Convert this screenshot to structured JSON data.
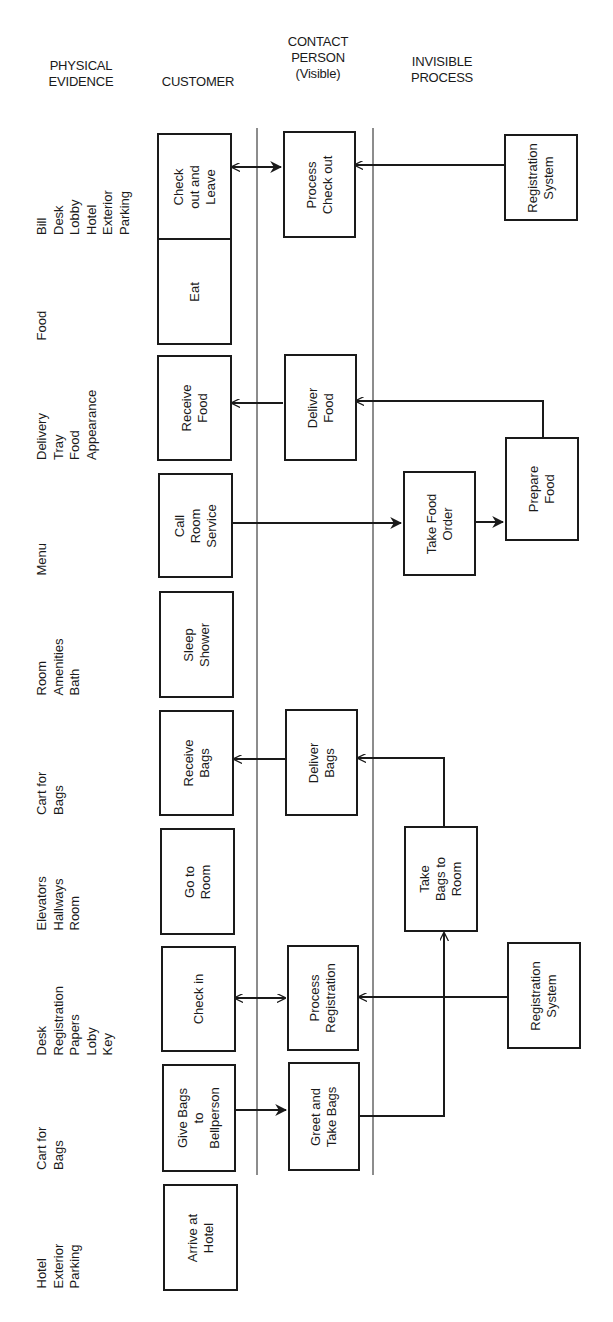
{
  "headers": {
    "physical_evidence": [
      "PHYSICAL",
      "EVIDENCE"
    ],
    "customer": [
      "CUSTOMER"
    ],
    "contact_person": [
      "CONTACT",
      "PERSON",
      "(Visible)"
    ],
    "invisible_process": [
      "INVISIBLE",
      "PROCESS"
    ]
  },
  "physical_evidence": [
    {
      "lines": [
        "Bill",
        "Desk",
        "Lobby",
        "Hotel",
        "Exterior",
        "Parking"
      ]
    },
    {
      "lines": [
        "Food"
      ]
    },
    {
      "lines": [
        "Delivery",
        "Tray",
        "Food",
        "Appearance"
      ]
    },
    {
      "lines": [
        "Menu"
      ]
    },
    {
      "lines": [
        "Room",
        "Amenities",
        "Bath"
      ]
    },
    {
      "lines": [
        "Cart for",
        "Bags"
      ]
    },
    {
      "lines": [
        "Elevators",
        "Hallways",
        "Room"
      ]
    },
    {
      "lines": [
        "Desk",
        "Registration",
        "Papers",
        "Loby",
        "Key"
      ]
    },
    {
      "lines": [
        "Cart for",
        "Bags"
      ]
    },
    {
      "lines": [
        "Hotel",
        "Exterior",
        "Parking"
      ]
    }
  ],
  "customer_actions": [
    {
      "lines": [
        "Check",
        "out and",
        "Leave"
      ]
    },
    {
      "lines": [
        "Eat"
      ]
    },
    {
      "lines": [
        "Receive",
        "Food"
      ]
    },
    {
      "lines": [
        "Call",
        "Room",
        "Service"
      ]
    },
    {
      "lines": [
        "Sleep",
        "Shower"
      ]
    },
    {
      "lines": [
        "Receive",
        "Bags"
      ]
    },
    {
      "lines": [
        "Go to",
        "Room"
      ]
    },
    {
      "lines": [
        "Check in"
      ]
    },
    {
      "lines": [
        "Give Bags",
        "to",
        "Bellperson"
      ]
    },
    {
      "lines": [
        "Arrive at",
        "Hotel"
      ]
    }
  ],
  "contact_actions": [
    {
      "lines": [
        "Process",
        "Check out"
      ]
    },
    {
      "lines": [
        "Deliver",
        "Food"
      ]
    },
    {
      "lines": [
        "Deliver",
        "Bags"
      ]
    },
    {
      "lines": [
        "Process",
        "Registration"
      ]
    },
    {
      "lines": [
        "Greet and",
        "Take Bags"
      ]
    }
  ],
  "invisible_actions": [
    {
      "lines": [
        "Registration",
        "System"
      ]
    },
    {
      "lines": [
        "Take Food",
        "Order"
      ]
    },
    {
      "lines": [
        "Prepare",
        "Food"
      ]
    },
    {
      "lines": [
        "Take",
        "Bags to",
        "Room"
      ]
    },
    {
      "lines": [
        "Registration",
        "System"
      ]
    }
  ],
  "colors": {
    "ink": "#1a1a1a",
    "background": "#ffffff"
  }
}
